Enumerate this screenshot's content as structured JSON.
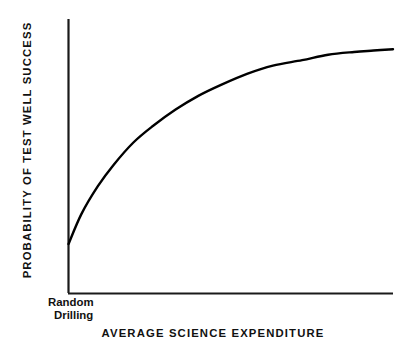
{
  "chart_data": {
    "type": "line",
    "title": "",
    "xlabel": "AVERAGE SCIENCE EXPENDITURE",
    "ylabel": "PROBABILITY OF TEST WELL SUCCESS",
    "grid": false,
    "legend": "none",
    "axis_ticks": "none",
    "xlim": [
      0,
      100
    ],
    "ylim": [
      0,
      100
    ],
    "annotations": [
      {
        "name": "origin-annotation",
        "line1": "Random",
        "line2": "Drilling",
        "at_x": 0,
        "at_y": 0
      }
    ],
    "series": [
      {
        "name": "probability-of-success-curve",
        "shape": "concave-increasing-saturating",
        "color": "#000000",
        "line_width": 2,
        "x": [
          0,
          4,
          9,
          14,
          20,
          26,
          33,
          40,
          47,
          55,
          63,
          72,
          80,
          88,
          94,
          100
        ],
        "y": [
          18,
          29,
          39,
          47,
          55,
          61,
          67,
          72,
          76,
          80,
          83,
          85,
          87,
          88,
          88.5,
          89
        ]
      }
    ]
  },
  "axes": {
    "y_axis_name": "y-axis-line",
    "x_axis_name": "x-axis-line",
    "color": "#1a1a1a"
  },
  "colors": {
    "background": "#ffffff",
    "ink": "#000000",
    "text": "#111111"
  }
}
